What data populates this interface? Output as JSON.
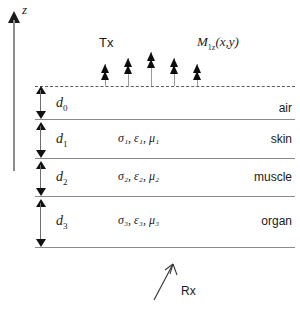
{
  "diagram": {
    "axis": {
      "label": "z",
      "name": "vertical-axis"
    },
    "source": {
      "tx_label": "Tx",
      "field_label_base": "M",
      "field_label_sub": "1z",
      "field_label_args": "(x,y)",
      "arrow_count": 5
    },
    "receiver": {
      "label": "Rx"
    },
    "layers": [
      {
        "thickness_base": "d",
        "thickness_sub": "0",
        "properties": "",
        "name": "air"
      },
      {
        "thickness_base": "d",
        "thickness_sub": "1",
        "properties": "σ₁, ε₁, μ₁",
        "name": "skin"
      },
      {
        "thickness_base": "d",
        "thickness_sub": "2",
        "properties": "σ₂, ε₂, μ₂",
        "name": "muscle"
      },
      {
        "thickness_base": "d",
        "thickness_sub": "3",
        "properties": "σ₃, ε₃, μ₃",
        "name": "organ"
      }
    ],
    "colors": {
      "line": "#8a8a8a",
      "arrow": "#111111",
      "text": "#1a1a1a",
      "background": "#ffffff"
    }
  }
}
